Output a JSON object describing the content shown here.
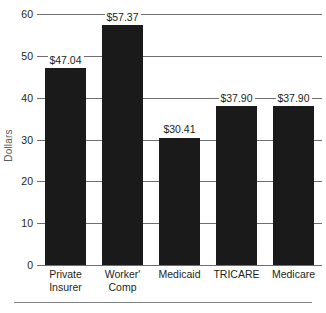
{
  "chart_data": {
    "type": "bar",
    "title": "",
    "xlabel": "",
    "ylabel": "Dollars",
    "ylim": [
      0,
      60
    ],
    "grid": true,
    "legend": "none",
    "bar_color": "#1a1a1a",
    "categories": [
      "Private Insurer",
      "Worker' Comp",
      "Medicaid",
      "TRICARE",
      "Medicare"
    ],
    "category_lines": [
      [
        "Private",
        "Insurer"
      ],
      [
        "Worker'",
        "Comp"
      ],
      [
        "Medicaid"
      ],
      [
        "TRICARE"
      ],
      [
        "Medicare"
      ]
    ],
    "values": [
      47.04,
      57.37,
      30.41,
      37.9,
      37.9
    ],
    "data_labels": [
      "$47.04",
      "$57.37",
      "$30.41",
      "$37.90",
      "$37.90"
    ],
    "yticks": [
      0,
      10,
      20,
      30,
      40,
      50,
      60
    ],
    "ytick_labels": [
      "0",
      "10",
      "20",
      "30",
      "40",
      "50",
      "60"
    ]
  }
}
